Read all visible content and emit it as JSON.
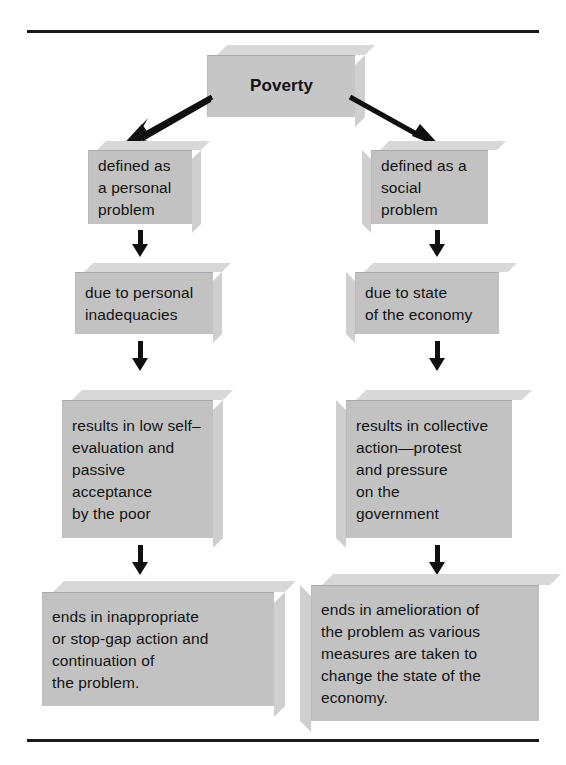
{
  "diagram": {
    "title": "Poverty",
    "type": "flow-chart",
    "rules": {
      "top": "horizontal-rule",
      "bottom": "horizontal-rule"
    },
    "root": {
      "label": "Poverty"
    },
    "branches": [
      {
        "name": "personal-problem-branch",
        "steps": [
          {
            "label": "defined as\na personal\nproblem"
          },
          {
            "label": "due to personal\ninadequacies"
          },
          {
            "label": "results in low self–\nevaluation and\npassive\nacceptance\nby the poor"
          },
          {
            "label": "ends in inappropriate\nor stop-gap action and\ncontinuation of\nthe problem."
          }
        ]
      },
      {
        "name": "social-problem-branch",
        "steps": [
          {
            "label": "defined as a\nsocial\nproblem"
          },
          {
            "label": "due to state\nof the economy"
          },
          {
            "label": "results in collective\naction—protest\nand pressure\non the\ngovernment"
          },
          {
            "label": "ends in amelioration of\nthe problem as various\nmeasures are taken to\nchange the state of the\neconomy."
          }
        ]
      }
    ],
    "colors": {
      "box_front": "#c2c2c2",
      "box_top": "#d8d8d8",
      "box_side": "#cfcfcf",
      "arrow": "#101010",
      "rule": "#1a1a1a",
      "text": "#121212",
      "background": "#ffffff"
    }
  }
}
